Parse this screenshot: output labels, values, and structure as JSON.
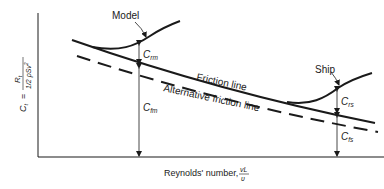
{
  "diagram": {
    "type": "resistance-coefficient vs Reynolds number schematic",
    "y_axis_label": {
      "lhs": "C",
      "lhs_sub": "t",
      "eq": "=",
      "num": "R",
      "num_sub": "t",
      "den": "1/2 ρSv",
      "den_sup": "2"
    },
    "x_axis_label": {
      "text": "Reynolds' number,",
      "frac_num": "vL",
      "frac_den": "υ"
    },
    "curves": {
      "model": "Model",
      "ship": "Ship",
      "friction_line": "Friction line",
      "alt_friction_line": "Alternative friction line"
    },
    "dimensions": {
      "crm": {
        "base": "C",
        "sub": "rm"
      },
      "cfm": {
        "base": "C",
        "sub": "fm"
      },
      "crs": {
        "base": "C",
        "sub": "rs"
      },
      "cfs": {
        "base": "C",
        "sub": "fs"
      }
    },
    "colors": {
      "ink": "#1a1a1a",
      "background": "#ffffff"
    }
  }
}
